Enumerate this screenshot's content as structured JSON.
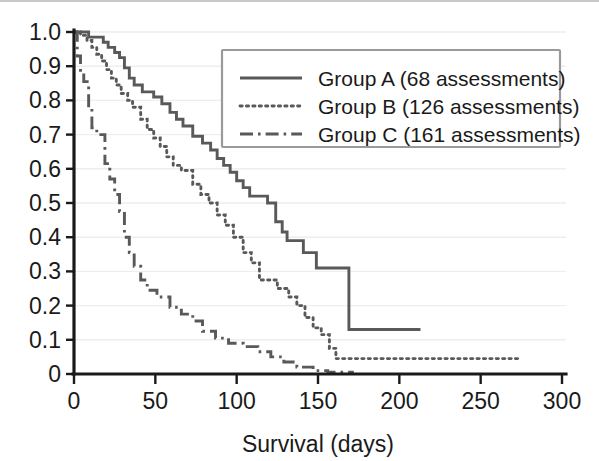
{
  "chart_data": {
    "type": "line",
    "title": "",
    "subtitle": "",
    "xlabel": "Survival (days)",
    "ylabel": "",
    "xlim": [
      0,
      300
    ],
    "ylim": [
      0,
      1.0
    ],
    "xticks": [
      0,
      50,
      100,
      150,
      200,
      250,
      300
    ],
    "xtick_labels": [
      "0",
      "50",
      "100",
      "150",
      "200",
      "250",
      "300"
    ],
    "yticks": [
      0,
      0.1,
      0.2,
      0.3,
      0.4,
      0.5,
      0.6,
      0.7,
      0.8,
      0.9,
      1.0
    ],
    "ytick_labels": [
      "0",
      "0.1",
      "0.2",
      "0.3",
      "0.4",
      "0.5",
      "0.6",
      "0.7",
      "0.8",
      "0.9",
      "1.0"
    ],
    "grid": "horizontal",
    "legend_position": "top-right",
    "plot_kind": "kaplan-meier-survival-step",
    "series": [
      {
        "name": "Group A (68 assessments)",
        "label": "Group A (68 assessments)",
        "linestyle": "solid",
        "color": "#595959",
        "assessments": 68,
        "points": [
          [
            0,
            1.0
          ],
          [
            8,
            1.0
          ],
          [
            9,
            0.985
          ],
          [
            14,
            0.985
          ],
          [
            15,
            0.985
          ],
          [
            18,
            0.97
          ],
          [
            20,
            0.97
          ],
          [
            21,
            0.955
          ],
          [
            24,
            0.955
          ],
          [
            25,
            0.94
          ],
          [
            27,
            0.94
          ],
          [
            28,
            0.925
          ],
          [
            30,
            0.925
          ],
          [
            31,
            0.895
          ],
          [
            33,
            0.895
          ],
          [
            34,
            0.865
          ],
          [
            36,
            0.865
          ],
          [
            37,
            0.845
          ],
          [
            41,
            0.845
          ],
          [
            42,
            0.825
          ],
          [
            48,
            0.825
          ],
          [
            49,
            0.81
          ],
          [
            53,
            0.81
          ],
          [
            54,
            0.79
          ],
          [
            58,
            0.79
          ],
          [
            59,
            0.765
          ],
          [
            62,
            0.765
          ],
          [
            63,
            0.745
          ],
          [
            66,
            0.745
          ],
          [
            67,
            0.725
          ],
          [
            72,
            0.725
          ],
          [
            73,
            0.695
          ],
          [
            78,
            0.695
          ],
          [
            79,
            0.675
          ],
          [
            83,
            0.675
          ],
          [
            84,
            0.655
          ],
          [
            87,
            0.655
          ],
          [
            88,
            0.63
          ],
          [
            91,
            0.63
          ],
          [
            92,
            0.61
          ],
          [
            95,
            0.61
          ],
          [
            96,
            0.59
          ],
          [
            99,
            0.59
          ],
          [
            100,
            0.565
          ],
          [
            103,
            0.565
          ],
          [
            104,
            0.545
          ],
          [
            107,
            0.545
          ],
          [
            108,
            0.52
          ],
          [
            118,
            0.52
          ],
          [
            119,
            0.5
          ],
          [
            123,
            0.5
          ],
          [
            124,
            0.445
          ],
          [
            127,
            0.445
          ],
          [
            128,
            0.415
          ],
          [
            130,
            0.415
          ],
          [
            131,
            0.39
          ],
          [
            140,
            0.39
          ],
          [
            141,
            0.355
          ],
          [
            148,
            0.355
          ],
          [
            149,
            0.31
          ],
          [
            168,
            0.31
          ],
          [
            169,
            0.13
          ],
          [
            213,
            0.13
          ]
        ]
      },
      {
        "name": "Group B (126 assessments)",
        "label": "Group B (126 assessments)",
        "linestyle": "dotted",
        "color": "#595959",
        "assessments": 126,
        "points": [
          [
            0,
            1.0
          ],
          [
            3,
            1.0
          ],
          [
            4,
            0.99
          ],
          [
            7,
            0.99
          ],
          [
            8,
            0.975
          ],
          [
            10,
            0.975
          ],
          [
            11,
            0.955
          ],
          [
            13,
            0.955
          ],
          [
            14,
            0.935
          ],
          [
            16,
            0.935
          ],
          [
            17,
            0.915
          ],
          [
            19,
            0.915
          ],
          [
            20,
            0.89
          ],
          [
            22,
            0.89
          ],
          [
            23,
            0.865
          ],
          [
            25,
            0.865
          ],
          [
            26,
            0.845
          ],
          [
            28,
            0.845
          ],
          [
            29,
            0.82
          ],
          [
            32,
            0.82
          ],
          [
            33,
            0.8
          ],
          [
            35,
            0.8
          ],
          [
            36,
            0.78
          ],
          [
            40,
            0.78
          ],
          [
            41,
            0.745
          ],
          [
            44,
            0.745
          ],
          [
            45,
            0.715
          ],
          [
            48,
            0.715
          ],
          [
            49,
            0.69
          ],
          [
            52,
            0.69
          ],
          [
            53,
            0.665
          ],
          [
            56,
            0.665
          ],
          [
            57,
            0.635
          ],
          [
            60,
            0.635
          ],
          [
            61,
            0.61
          ],
          [
            65,
            0.61
          ],
          [
            66,
            0.595
          ],
          [
            72,
            0.595
          ],
          [
            73,
            0.555
          ],
          [
            77,
            0.555
          ],
          [
            78,
            0.525
          ],
          [
            82,
            0.525
          ],
          [
            83,
            0.5
          ],
          [
            87,
            0.5
          ],
          [
            88,
            0.465
          ],
          [
            92,
            0.465
          ],
          [
            93,
            0.435
          ],
          [
            97,
            0.435
          ],
          [
            98,
            0.4
          ],
          [
            103,
            0.4
          ],
          [
            104,
            0.355
          ],
          [
            108,
            0.355
          ],
          [
            109,
            0.325
          ],
          [
            113,
            0.325
          ],
          [
            114,
            0.275
          ],
          [
            124,
            0.275
          ],
          [
            125,
            0.25
          ],
          [
            131,
            0.25
          ],
          [
            132,
            0.225
          ],
          [
            136,
            0.225
          ],
          [
            137,
            0.2
          ],
          [
            141,
            0.2
          ],
          [
            142,
            0.165
          ],
          [
            146,
            0.165
          ],
          [
            147,
            0.135
          ],
          [
            151,
            0.135
          ],
          [
            152,
            0.115
          ],
          [
            156,
            0.115
          ],
          [
            157,
            0.075
          ],
          [
            160,
            0.075
          ],
          [
            161,
            0.045
          ],
          [
            274,
            0.045
          ]
        ]
      },
      {
        "name": "Group C (161 assessments)",
        "label": "Group C (161 assessments)",
        "linestyle": "dashdot",
        "color": "#595959",
        "assessments": 161,
        "points": [
          [
            0,
            1.0
          ],
          [
            1,
            1.0
          ],
          [
            2,
            0.93
          ],
          [
            3,
            0.93
          ],
          [
            4,
            0.88
          ],
          [
            5,
            0.88
          ],
          [
            6,
            0.855
          ],
          [
            8,
            0.855
          ],
          [
            9,
            0.78
          ],
          [
            10,
            0.78
          ],
          [
            11,
            0.72
          ],
          [
            13,
            0.72
          ],
          [
            14,
            0.7
          ],
          [
            18,
            0.7
          ],
          [
            19,
            0.615
          ],
          [
            21,
            0.615
          ],
          [
            22,
            0.57
          ],
          [
            24,
            0.57
          ],
          [
            25,
            0.525
          ],
          [
            27,
            0.525
          ],
          [
            28,
            0.475
          ],
          [
            30,
            0.475
          ],
          [
            31,
            0.4
          ],
          [
            33,
            0.4
          ],
          [
            34,
            0.355
          ],
          [
            36,
            0.355
          ],
          [
            37,
            0.315
          ],
          [
            40,
            0.315
          ],
          [
            41,
            0.275
          ],
          [
            44,
            0.275
          ],
          [
            45,
            0.245
          ],
          [
            50,
            0.245
          ],
          [
            51,
            0.225
          ],
          [
            58,
            0.225
          ],
          [
            59,
            0.195
          ],
          [
            65,
            0.195
          ],
          [
            66,
            0.175
          ],
          [
            72,
            0.175
          ],
          [
            73,
            0.155
          ],
          [
            78,
            0.155
          ],
          [
            79,
            0.125
          ],
          [
            86,
            0.125
          ],
          [
            87,
            0.105
          ],
          [
            94,
            0.105
          ],
          [
            95,
            0.09
          ],
          [
            103,
            0.09
          ],
          [
            104,
            0.08
          ],
          [
            112,
            0.08
          ],
          [
            113,
            0.065
          ],
          [
            120,
            0.065
          ],
          [
            121,
            0.05
          ],
          [
            128,
            0.05
          ],
          [
            129,
            0.035
          ],
          [
            136,
            0.035
          ],
          [
            137,
            0.02
          ],
          [
            146,
            0.02
          ],
          [
            147,
            0.01
          ],
          [
            155,
            0.01
          ],
          [
            156,
            0.005
          ],
          [
            172,
            0.005
          ]
        ]
      }
    ],
    "colors": {
      "curve": "#595959",
      "axis": "#1a1a1a",
      "grid": "#eeeeee",
      "legend_border": "#9a9a9a",
      "background": "#ffffff"
    }
  }
}
